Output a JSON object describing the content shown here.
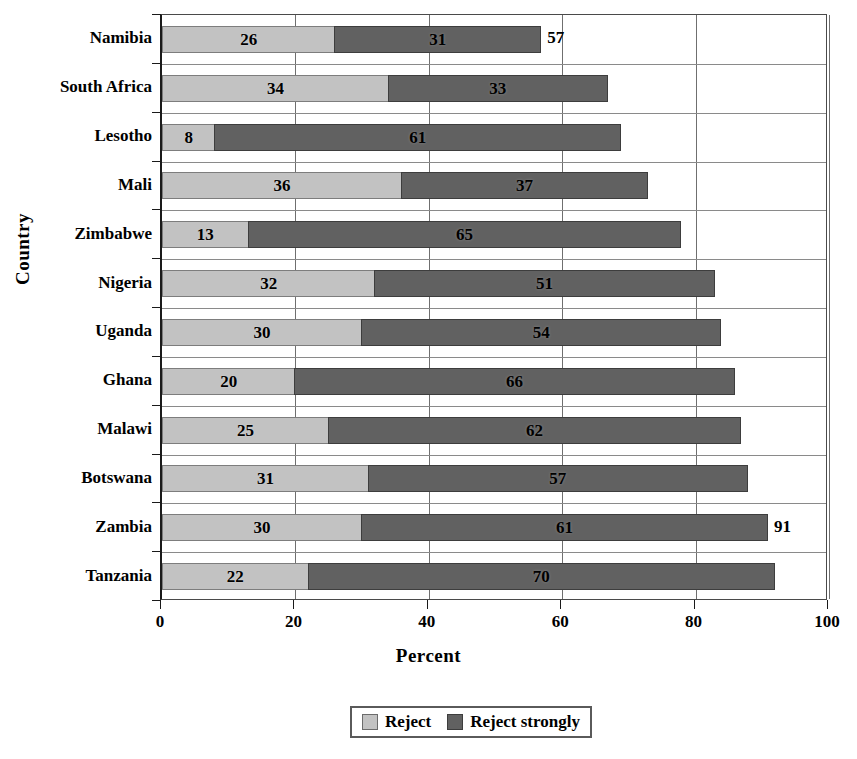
{
  "chart_data": {
    "type": "bar",
    "orientation": "horizontal",
    "stacked": true,
    "title": "",
    "xlabel": "Percent",
    "ylabel": "Country",
    "xlim": [
      0,
      100
    ],
    "xticks": [
      0,
      20,
      40,
      60,
      80,
      100
    ],
    "grid": true,
    "legend_position": "bottom",
    "categories": [
      "Namibia",
      "South Africa",
      "Lesotho",
      "Mali",
      "Zimbabwe",
      "Nigeria",
      "Uganda",
      "Ghana",
      "Malawi",
      "Botswana",
      "Zambia",
      "Tanzania"
    ],
    "series": [
      {
        "name": "Reject",
        "color": "#c2c2c2",
        "values": [
          26,
          34,
          8,
          36,
          13,
          32,
          30,
          20,
          25,
          31,
          30,
          22
        ]
      },
      {
        "name": "Reject strongly",
        "color": "#616161",
        "values": [
          31,
          33,
          61,
          37,
          65,
          51,
          54,
          66,
          62,
          57,
          61,
          70
        ]
      }
    ],
    "totals": [
      57,
      67,
      69,
      73,
      78,
      83,
      84,
      86,
      87,
      88,
      91,
      92
    ],
    "total_labels_shown": [
      57,
      null,
      null,
      null,
      null,
      null,
      null,
      null,
      null,
      null,
      91,
      null
    ],
    "annotations": [
      {
        "category": "Namibia",
        "text": "57",
        "kind": "total"
      },
      {
        "category": "Zambia",
        "text": "91",
        "kind": "total"
      }
    ]
  },
  "legend": {
    "items": [
      {
        "label": "Reject",
        "swatch": "light-gray-swatch"
      },
      {
        "label": "Reject strongly",
        "swatch": "dark-gray-swatch"
      }
    ]
  },
  "axes": {
    "x_title": "Percent",
    "y_title": "Country",
    "x_tick_labels": [
      "0",
      "20",
      "40",
      "60",
      "80",
      "100"
    ]
  }
}
